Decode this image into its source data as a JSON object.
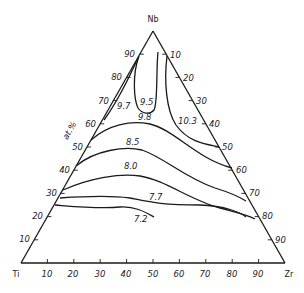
{
  "diagram": {
    "type": "ternary-contour",
    "vertices": {
      "top": "Nb",
      "left": "Ti",
      "right": "Zr"
    },
    "axis_unit_label": "at.%",
    "left_edge_ticks": [
      "10",
      "20",
      "30",
      "40",
      "50",
      "60",
      "70",
      "80",
      "90"
    ],
    "right_edge_ticks": [
      "10",
      "20",
      "30",
      "40",
      "50",
      "60",
      "70",
      "80",
      "90"
    ],
    "bottom_edge_ticks": [
      "10",
      "20",
      "30",
      "40",
      "50",
      "60",
      "70",
      "80",
      "90"
    ],
    "contour_labels": [
      "9.5",
      "9.7",
      "10.3",
      "9.8",
      "8.5",
      "8.0",
      "7.7",
      "7.2"
    ]
  }
}
